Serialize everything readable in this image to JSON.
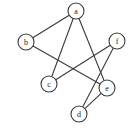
{
  "figure": {
    "width": 135,
    "height": 133,
    "background_color": "#ffffff",
    "stroke_color": "#3a3a3a",
    "label_color": "#1a1a1a",
    "node_fill_color": "#ffffff",
    "node_radius": 8
  },
  "chart_data": {
    "type": "diagram",
    "subtype": "node-link-graph",
    "directed": false,
    "title": "",
    "xlabel": "",
    "ylabel": "",
    "grid": false,
    "legend": null,
    "node_count": 6,
    "edge_count": 7,
    "nodes": [
      {
        "id": "a",
        "label": "a",
        "x": 76,
        "y": 11,
        "r": 8,
        "degree": 3
      },
      {
        "id": "b",
        "label": "b",
        "x": 26,
        "y": 42,
        "r": 8,
        "degree": 2
      },
      {
        "id": "c",
        "label": "c",
        "x": 49,
        "y": 84,
        "r": 8,
        "degree": 2
      },
      {
        "id": "d",
        "label": "d",
        "x": 79,
        "y": 114,
        "r": 8,
        "degree": 2
      },
      {
        "id": "e",
        "label": "e",
        "x": 107,
        "y": 88,
        "r": 8,
        "degree": 3
      },
      {
        "id": "f",
        "label": "f",
        "x": 117,
        "y": 41,
        "r": 8,
        "degree": 2
      }
    ],
    "edges": [
      {
        "source": "a",
        "target": "b"
      },
      {
        "source": "a",
        "target": "c"
      },
      {
        "source": "a",
        "target": "e"
      },
      {
        "source": "b",
        "target": "e"
      },
      {
        "source": "c",
        "target": "f"
      },
      {
        "source": "d",
        "target": "e"
      },
      {
        "source": "d",
        "target": "f"
      }
    ]
  }
}
